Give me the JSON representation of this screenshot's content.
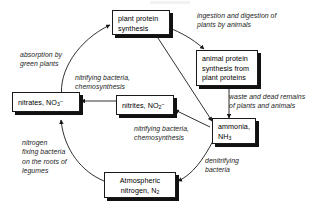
{
  "diagram": {
    "type": "cycle-flow-diagram",
    "background_color": "#ffffff",
    "box_border_color": "#1a1a1a",
    "box_fill_color": "#ffffff",
    "shadow_color": "#111111",
    "text_color": "#000000",
    "label_text_color": "#1c1c1c"
  },
  "nodes": [
    {
      "id": "plant-protein-synthesis",
      "label": "plant protein\nsynthesis",
      "line1": "plant protein",
      "line2": "synthesis"
    },
    {
      "id": "animal-protein-synthesis",
      "label": "animal protein\nsynthesis from\nplant proteins",
      "line1": "animal protein",
      "line2": "synthesis from",
      "line3": "plant proteins"
    },
    {
      "id": "nitrates",
      "label": "nitrates, NO3-",
      "text_before": "nitrates, NO",
      "subscript": "3",
      "superscript": "–"
    },
    {
      "id": "nitrites",
      "label": "nitrites, NO2-",
      "text_before": "nitrites, NO",
      "subscript": "2",
      "superscript": "–"
    },
    {
      "id": "ammonia",
      "label": "ammonia, NH3",
      "line1": "ammonia,",
      "line2_before": "NH",
      "line2_sub": "3"
    },
    {
      "id": "atmospheric-nitrogen",
      "label": "Atmospheric nitrogen, N2",
      "line1": "Atmospheric",
      "line2_before": "nitrogen, N",
      "line2_sub": "2"
    }
  ],
  "labels": {
    "ingestion": "ingestion and digestion of\nplants by animals",
    "absorption": "absorption by\ngreen plants",
    "nitrifying_upper": "nitrifying bacteria,\nchemosynthesis",
    "waste": "waste and dead remains\nof plants and animals",
    "nitrifying_lower": "nitrifying bacteria,\nchemosynthesis",
    "nitrogen_fixing": "nitrogen\nfixing bacteria\non the roots of\nlegumes",
    "denitrifying": "denitrifying\nbacteria"
  },
  "edges": [
    {
      "id": "plant-to-animal",
      "from": "plant-protein-synthesis",
      "to": "animal-protein-synthesis",
      "label": "ingestion and digestion of plants by animals"
    },
    {
      "id": "plant-to-ammonia",
      "from": "plant-protein-synthesis",
      "to": "ammonia",
      "label": ""
    },
    {
      "id": "animal-to-ammonia",
      "from": "animal-protein-synthesis",
      "to": "ammonia",
      "label": "waste and dead remains of plants and animals"
    },
    {
      "id": "ammonia-to-nitrites",
      "from": "ammonia",
      "to": "nitrites",
      "label": "nitrifying bacteria, chemosynthesis"
    },
    {
      "id": "nitrites-to-nitrates",
      "from": "nitrites",
      "to": "nitrates",
      "label": "nitrifying bacteria, chemosynthesis"
    },
    {
      "id": "nitrates-to-plant",
      "from": "nitrates",
      "to": "plant-protein-synthesis",
      "label": "absorption by green plants"
    },
    {
      "id": "ammonia-to-atmospheric",
      "from": "ammonia",
      "to": "atmospheric-nitrogen",
      "label": "denitrifying bacteria"
    },
    {
      "id": "atmospheric-to-nitrates",
      "from": "atmospheric-nitrogen",
      "to": "nitrates",
      "label": "nitrogen fixing bacteria on the roots of legumes"
    }
  ]
}
